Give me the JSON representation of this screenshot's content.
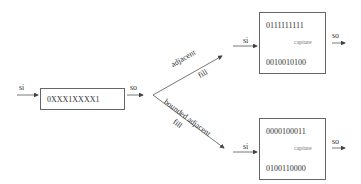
{
  "input": {
    "in_label": "si",
    "out_label": "so",
    "pattern": "0XXX1XXXX1"
  },
  "branches": [
    {
      "name": "adjacent",
      "label": "adjacent",
      "sublabel": "fill",
      "in_label": "si",
      "out_label": "so",
      "before": "0111111111",
      "after": "0010010100",
      "arrow_label": "capture"
    },
    {
      "name": "bounded-adjacent",
      "label": "bounded adjacent",
      "sublabel": "fill",
      "in_label": "si",
      "out_label": "so",
      "before": "0000100011",
      "after": "0100110000",
      "arrow_label": "capture"
    }
  ],
  "colors": {
    "line": "#555555",
    "text": "#333333",
    "box_border": "#666666"
  }
}
